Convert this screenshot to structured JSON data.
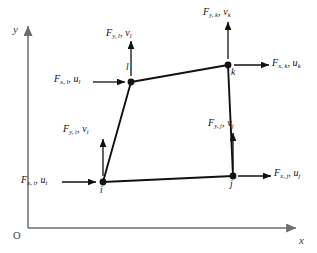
{
  "figure": {
    "type": "diagram",
    "background_color": "#ffffff",
    "element_stroke_color": "#111111",
    "axis_stroke_color": "#6e6e6e",
    "arrow_color": "#111111"
  },
  "axes": {
    "y_label": "y",
    "x_label": "x",
    "origin_label": "O",
    "y_axis": {
      "x": 28,
      "y_top": 22,
      "y_bottom": 228
    },
    "x_axis": {
      "y": 228,
      "x_left": 28,
      "x_right": 300
    }
  },
  "nodes": [
    {
      "id": "i",
      "label": "i",
      "x": 103,
      "y": 182,
      "label_x": 100,
      "label_y": 186
    },
    {
      "id": "j",
      "label": "j",
      "x": 233,
      "y": 176,
      "label_x": 230,
      "label_y": 180
    },
    {
      "id": "k",
      "label": "k",
      "x": 228,
      "y": 65,
      "label_x": 231,
      "label_y": 68
    },
    {
      "id": "l",
      "label": "l",
      "x": 131,
      "y": 82,
      "label_x": 126,
      "label_y": 64
    }
  ],
  "element_edges": [
    {
      "from": "i",
      "to": "j"
    },
    {
      "from": "j",
      "to": "k"
    },
    {
      "from": "k",
      "to": "l"
    },
    {
      "from": "l",
      "to": "i"
    }
  ],
  "force_arrows": [
    {
      "name": "force-x-i",
      "node": "i",
      "direction": "right",
      "symbol": "F",
      "sub_force": "x, i",
      "disp": "u",
      "sub_disp": "i",
      "label_x": 21,
      "label_y": 175,
      "arrow": {
        "x1": 62,
        "y1": 182,
        "x2": 96,
        "y2": 182
      }
    },
    {
      "name": "force-y-i",
      "node": "i",
      "direction": "up",
      "symbol": "F",
      "sub_force": "y, i",
      "disp": "v",
      "sub_disp": "i",
      "label_x": 63,
      "label_y": 124,
      "arrow": {
        "x1": 103,
        "y1": 176,
        "x2": 103,
        "y2": 139
      }
    },
    {
      "name": "force-x-j",
      "node": "j",
      "direction": "right",
      "symbol": "F",
      "sub_force": "x, j",
      "disp": "u",
      "sub_disp": "j",
      "label_x": 274,
      "label_y": 168,
      "arrow": {
        "x1": 238,
        "y1": 176,
        "x2": 271,
        "y2": 176
      }
    },
    {
      "name": "force-y-j",
      "node": "j",
      "direction": "up",
      "symbol": "F",
      "sub_force": "y, j",
      "disp": "v",
      "sub_disp": "j",
      "label_x": 208,
      "label_y": 118,
      "arrow": {
        "x1": 233,
        "y1": 170,
        "x2": 233,
        "y2": 133
      }
    },
    {
      "name": "force-x-k",
      "node": "k",
      "direction": "right",
      "symbol": "F",
      "sub_force": "x, k",
      "disp": "u",
      "sub_disp": "k",
      "label_x": 272,
      "label_y": 58,
      "arrow": {
        "x1": 234,
        "y1": 65,
        "x2": 269,
        "y2": 65
      }
    },
    {
      "name": "force-y-k",
      "node": "k",
      "direction": "up",
      "symbol": "F",
      "sub_force": "y, k",
      "disp": "v",
      "sub_disp": "k",
      "label_x": 203,
      "label_y": 7,
      "arrow": {
        "x1": 228,
        "y1": 59,
        "x2": 228,
        "y2": 22
      }
    },
    {
      "name": "force-x-l",
      "node": "l",
      "direction": "right",
      "symbol": "F",
      "sub_force": "x, l",
      "disp": "u",
      "sub_disp": "l",
      "label_x": 54,
      "label_y": 74,
      "arrow": {
        "x1": 93,
        "y1": 82,
        "x2": 125,
        "y2": 82
      }
    },
    {
      "name": "force-y-l",
      "node": "l",
      "direction": "up",
      "symbol": "F",
      "sub_force": "y, l",
      "disp": "v",
      "sub_disp": "l",
      "label_x": 106,
      "label_y": 28,
      "arrow": {
        "x1": 131,
        "y1": 76,
        "x2": 131,
        "y2": 41
      }
    }
  ]
}
